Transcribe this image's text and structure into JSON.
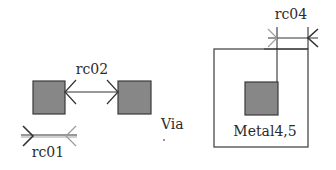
{
  "diagram": {
    "labels": {
      "rc01": "rc01",
      "rc02": "rc02",
      "rc04": "rc04",
      "via": "Via",
      "metal": "Metal4,5"
    },
    "colors": {
      "fill": "#878787",
      "stroke": "#3a3a3a",
      "line": "#333333",
      "text": "#2b2b2b",
      "background": "#ffffff"
    },
    "shapes": {
      "via_left": {
        "x": 33,
        "y": 81,
        "w": 32,
        "h": 33
      },
      "via_right": {
        "x": 118,
        "y": 81,
        "w": 33,
        "h": 33
      },
      "metal_box": {
        "x": 214,
        "y": 49,
        "w": 94,
        "h": 98
      },
      "metal_via": {
        "x": 245,
        "y": 82,
        "w": 33,
        "h": 33
      }
    },
    "dimensions": [
      {
        "name": "rc02",
        "description": "spacing between two vias"
      },
      {
        "name": "rc01",
        "description": "via width"
      },
      {
        "name": "rc04",
        "description": "metal enclosure of via"
      }
    ]
  }
}
